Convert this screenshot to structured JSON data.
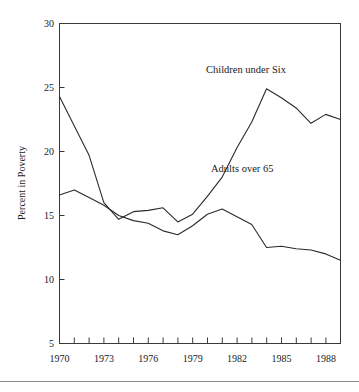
{
  "chart_data": {
    "type": "line",
    "title": "",
    "xlabel": "",
    "ylabel": "Percent in Poverty",
    "xlim": [
      1970,
      1989
    ],
    "ylim": [
      5,
      30
    ],
    "grid": false,
    "legend_position": "inline-annotation",
    "y_ticks": [
      5,
      10,
      15,
      20,
      25,
      30
    ],
    "y_tick_labels": [
      "5",
      "10",
      "15",
      "20",
      "25",
      "30"
    ],
    "x_ticks": [
      1970,
      1971,
      1972,
      1973,
      1974,
      1975,
      1976,
      1977,
      1978,
      1979,
      1980,
      1981,
      1982,
      1983,
      1984,
      1985,
      1986,
      1987,
      1988,
      1989
    ],
    "x_tick_labels": [
      "1970",
      "",
      "",
      "1973",
      "",
      "",
      "1976",
      "",
      "",
      "1979",
      "",
      "",
      "1982",
      "",
      "",
      "1985",
      "",
      "",
      "1988",
      ""
    ],
    "x": [
      1970,
      1971,
      1972,
      1973,
      1974,
      1975,
      1976,
      1977,
      1978,
      1979,
      1980,
      1981,
      1982,
      1983,
      1984,
      1985,
      1986,
      1987,
      1988,
      1989
    ],
    "series": [
      {
        "name": "Children under Six",
        "annotation": "Children under Six",
        "values": [
          24.3,
          22.0,
          19.7,
          16.0,
          14.7,
          15.3,
          15.4,
          15.6,
          14.5,
          15.1,
          16.5,
          18.0,
          20.3,
          22.3,
          24.9,
          24.2,
          23.4,
          22.2,
          22.9,
          22.5
        ]
      },
      {
        "name": "Adults over 65",
        "annotation": "Adults over 65",
        "values": [
          16.6,
          17.0,
          16.4,
          15.8,
          15.0,
          14.6,
          14.4,
          13.8,
          13.5,
          14.2,
          15.1,
          15.5,
          14.9,
          14.3,
          12.5,
          12.6,
          12.4,
          12.3,
          12.0,
          11.5
        ]
      }
    ],
    "annotations": [
      {
        "text": "Children under Six",
        "x_pos_px": 206,
        "y_pos_px": 73
      },
      {
        "text": "Adults over 65",
        "x_pos_px": 211,
        "y_pos_px": 172
      }
    ]
  }
}
